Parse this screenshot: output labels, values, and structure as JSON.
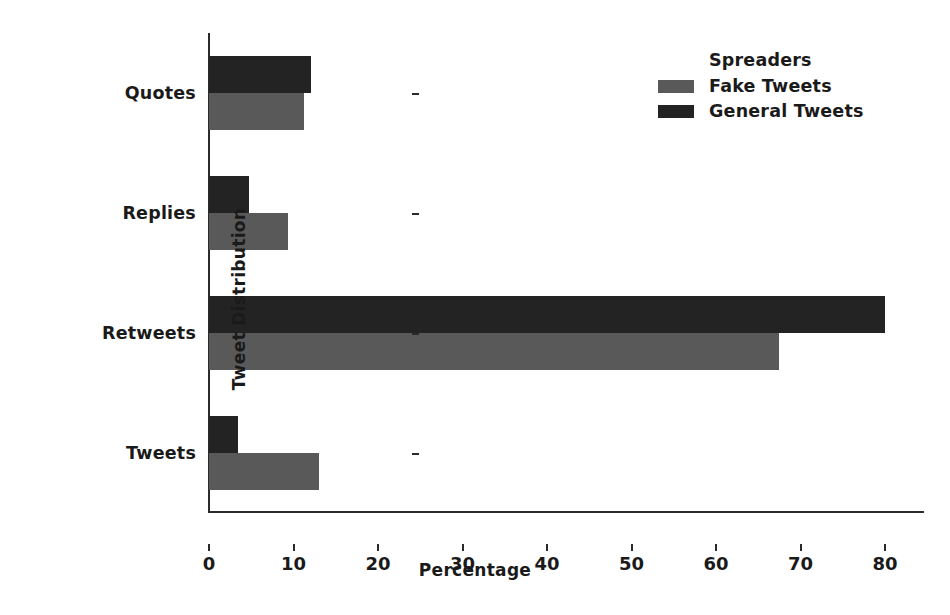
{
  "chart_data": {
    "type": "bar",
    "orientation": "horizontal",
    "title": "",
    "xlabel": "Percentage",
    "ylabel": "Tweet Distribution",
    "categories": [
      "Tweets",
      "Retweets",
      "Replies",
      "Quotes"
    ],
    "series": [
      {
        "name": "Fake Tweets",
        "color": "#595959",
        "values": [
          13.0,
          67.5,
          9.3,
          11.2
        ]
      },
      {
        "name": "General Tweets",
        "color": "#232323",
        "values": [
          3.4,
          80.0,
          4.7,
          12.1
        ]
      }
    ],
    "legend": {
      "title": "Spreaders",
      "position": "upper right",
      "entries": [
        {
          "label": "Fake Tweets",
          "color": "#595959"
        },
        {
          "label": "General Tweets",
          "color": "#232323"
        }
      ]
    },
    "xlim": [
      0,
      84.5
    ],
    "xticks": [
      0,
      10,
      20,
      30,
      40,
      50,
      60,
      70,
      80
    ],
    "xticklabels": [
      "0",
      "10",
      "20",
      "30",
      "40",
      "50",
      "60",
      "70",
      "80"
    ],
    "grid": false
  }
}
